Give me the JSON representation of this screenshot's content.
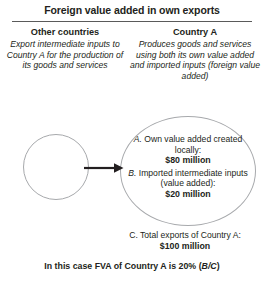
{
  "figure": {
    "title": "Foreign value added in own exports"
  },
  "columns": {
    "left": {
      "heading": "Other countries",
      "description": "Export intermediate inputs to Country A for the production of its goods and services"
    },
    "right": {
      "heading": "Country A",
      "description": "Produces goods and services using both its own value added and imported inputs (foreign value added)"
    }
  },
  "diagram": {
    "left_circle_label": "",
    "flow_arrow": "arrow-right",
    "items": [
      {
        "tag": "A.",
        "text": " Own value added created locally:",
        "amount": "$80 million"
      },
      {
        "tag": "B.",
        "text": " Imported intermediate inputs (value added):",
        "amount": "$20 million"
      }
    ],
    "total": {
      "tag": "C.",
      "text": " Total exports of Country A:",
      "amount": "$100 million"
    }
  },
  "footer": {
    "note_prefix": "In this case FVA of Country A is 20% (",
    "note_ratio": "B/C",
    "note_suffix": ")"
  },
  "colors": {
    "text": "#231f20",
    "rule": "#5a5a5a",
    "circle_stroke": "#a7a9ac",
    "arrow": "#231f20",
    "background": "#ffffff"
  }
}
